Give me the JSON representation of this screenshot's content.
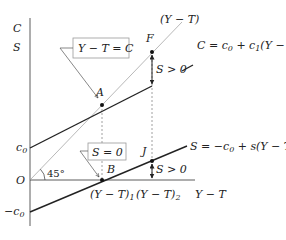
{
  "diagram": {
    "axes": {
      "y_label_top": "C",
      "y_label_bottom": "S",
      "x_label": "Y − T",
      "origin_label": "O"
    },
    "y_ticks": {
      "c0": "c",
      "c0_sub": "0",
      "neg_c0": "−c",
      "neg_c0_sub": "0"
    },
    "angle_label": "45°",
    "guide_line_label": "(Y − T)",
    "consumption_function": {
      "label_prefix": "C = c",
      "label_sub1": "0",
      "label_mid": " + c",
      "label_sub2": "1",
      "label_suffix": "(Y − T)"
    },
    "saving_function": {
      "label_prefix": "S = −c",
      "label_sub1": "0",
      "label_suffix": " + s(Y − T)"
    },
    "callouts": {
      "equality_box": "Y − T = C",
      "zero_saving_box": "S = 0"
    },
    "points": {
      "A": "A",
      "B": "B",
      "F": "F",
      "J": "J"
    },
    "x_ticks": {
      "yt1": "(Y − T)",
      "yt1_sub": "1",
      "yt2": "(Y − T)",
      "yt2_sub": "2"
    },
    "annotations": {
      "upper_gap": "S > 0",
      "lower_gap": "S > 0"
    },
    "colors": {
      "line": "#222222",
      "guide": "#9a9a9a",
      "dotted": "#888888",
      "box_border": "#999999"
    }
  }
}
